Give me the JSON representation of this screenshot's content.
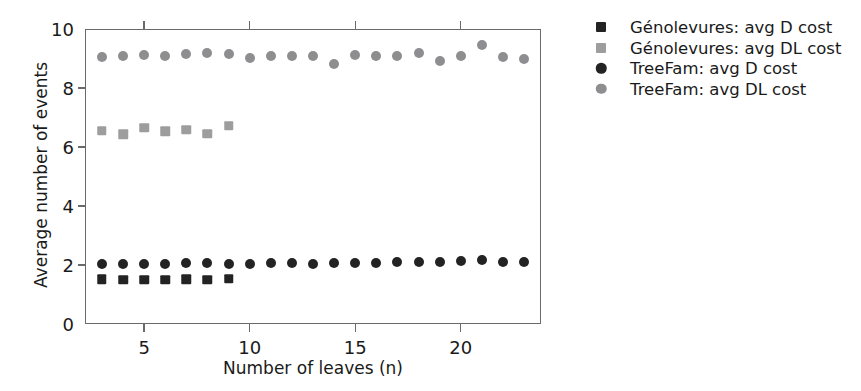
{
  "chart_data": {
    "type": "scatter",
    "title": "",
    "xlabel": "Number of leaves (n)",
    "ylabel": "Average number of events",
    "xlim": [
      2.2,
      23.8
    ],
    "ylim": [
      0,
      10
    ],
    "xticks": [
      5,
      10,
      15,
      20
    ],
    "yticks": [
      0,
      2,
      4,
      6,
      8,
      10
    ],
    "grid": false,
    "legend_position": "right",
    "series": [
      {
        "name": "Génolevures: avg D cost",
        "marker": "square",
        "color": "#232323",
        "x": [
          3,
          4,
          5,
          6,
          7,
          8,
          9
        ],
        "values": [
          1.52,
          1.5,
          1.5,
          1.5,
          1.52,
          1.5,
          1.53
        ]
      },
      {
        "name": "Génolevures: avg DL cost",
        "marker": "square",
        "color": "#9d9d9d",
        "x": [
          3,
          4,
          5,
          6,
          7,
          8,
          9
        ],
        "values": [
          6.55,
          6.44,
          6.65,
          6.54,
          6.58,
          6.45,
          6.72
        ]
      },
      {
        "name": "TreeFam: avg D cost",
        "marker": "circle",
        "color": "#232323",
        "x": [
          3,
          4,
          5,
          6,
          7,
          8,
          9,
          10,
          11,
          12,
          13,
          14,
          15,
          16,
          17,
          18,
          19,
          20,
          21,
          22,
          23
        ],
        "values": [
          2.04,
          2.05,
          2.05,
          2.05,
          2.06,
          2.06,
          2.05,
          2.05,
          2.06,
          2.07,
          2.05,
          2.06,
          2.08,
          2.08,
          2.09,
          2.1,
          2.09,
          2.12,
          2.16,
          2.1,
          2.1
        ]
      },
      {
        "name": "TreeFam: avg DL cost",
        "marker": "circle",
        "color": "#8e8e90",
        "x": [
          3,
          4,
          5,
          6,
          7,
          8,
          9,
          10,
          11,
          12,
          13,
          14,
          15,
          16,
          17,
          18,
          19,
          20,
          21,
          22,
          23
        ],
        "values": [
          9.05,
          9.08,
          9.12,
          9.1,
          9.14,
          9.2,
          9.14,
          9.02,
          9.1,
          9.08,
          9.08,
          8.83,
          9.12,
          9.08,
          9.1,
          9.2,
          8.93,
          9.1,
          9.45,
          9.05,
          8.98
        ]
      }
    ]
  },
  "legend": {
    "items": [
      {
        "label": "Génolevures: avg D cost",
        "marker": "square",
        "color": "#232323"
      },
      {
        "label": "Génolevures: avg DL cost",
        "marker": "square",
        "color": "#9d9d9d"
      },
      {
        "label": "TreeFam: avg D cost",
        "marker": "circle",
        "color": "#232323"
      },
      {
        "label": "TreeFam: avg DL cost",
        "marker": "circle",
        "color": "#8e8e90"
      }
    ]
  },
  "axes": {
    "y_title": "Average number of events",
    "x_title": "Number of leaves (n)",
    "x_tick_labels": [
      "5",
      "10",
      "15",
      "20"
    ],
    "y_tick_labels": [
      "0",
      "2",
      "4",
      "6",
      "8",
      "10"
    ]
  },
  "colors": {
    "axis": "#6a6a6a",
    "text": "#1a1a1a",
    "dark_marker": "#232323",
    "grey_square": "#9d9d9d",
    "grey_circle": "#8e8e90",
    "background": "#ffffff"
  }
}
